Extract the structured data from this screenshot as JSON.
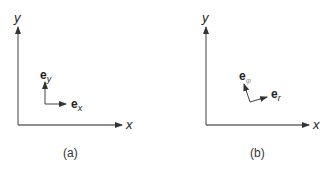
{
  "figures": [
    {
      "id": "a",
      "caption": "(a)",
      "axis_x_label": "x",
      "axis_y_label": "y",
      "vector_1": {
        "base": "e",
        "sub": "x"
      },
      "vector_2": {
        "base": "e",
        "sub": "y"
      }
    },
    {
      "id": "b",
      "caption": "(b)",
      "axis_x_label": "x",
      "axis_y_label": "y",
      "vector_1": {
        "base": "e",
        "sub": "r"
      },
      "vector_2": {
        "base": "e",
        "sub": "φ"
      }
    }
  ],
  "colors": {
    "axis": "#6a6a6a",
    "text": "#222222"
  }
}
